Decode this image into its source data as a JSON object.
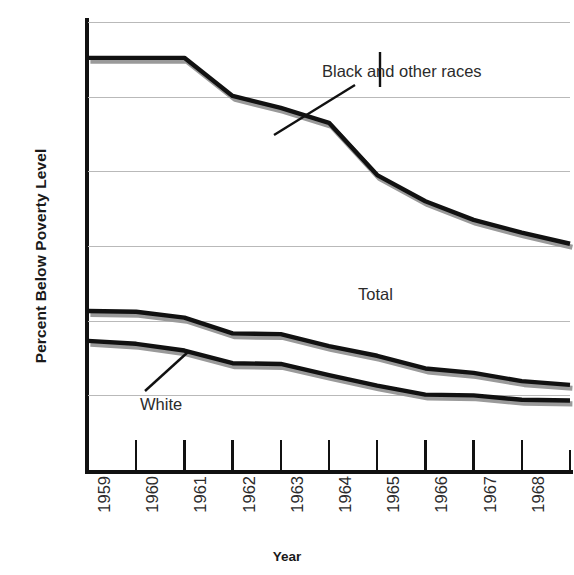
{
  "chart_data": {
    "type": "line",
    "title": "",
    "xlabel": "Year",
    "ylabel": "Percent Below Poverty Level",
    "x": [
      1959,
      1960,
      1961,
      1962,
      1963,
      1964,
      1965,
      1966,
      1967,
      1968,
      1969
    ],
    "categories": [
      "1959",
      "1960",
      "1961",
      "1962",
      "1963",
      "1964",
      "1965",
      "1966",
      "1967",
      "1968",
      "1969"
    ],
    "xlim": [
      1959,
      1969
    ],
    "ylim": [
      0,
      60
    ],
    "yticks": [
      0,
      10,
      20,
      30,
      40,
      50,
      60
    ],
    "ytick_labels": [
      "0",
      "10",
      "20",
      "30",
      "40",
      "50",
      "60"
    ],
    "grid": true,
    "legend_position": "inline-annotations",
    "series": [
      {
        "name": "Black and other races",
        "color": "#111111",
        "shadow_color": "#9a9a9a",
        "values": [
          55.2,
          55.2,
          55.2,
          50.1,
          48.5,
          46.5,
          39.5,
          36.0,
          33.5,
          31.8,
          30.3
        ]
      },
      {
        "name": "Total",
        "color": "#111111",
        "shadow_color": "#9a9a9a",
        "values": [
          21.3,
          21.2,
          20.4,
          18.3,
          18.2,
          16.6,
          15.3,
          13.6,
          13.0,
          11.9,
          11.4
        ]
      },
      {
        "name": "White",
        "color": "#111111",
        "shadow_color": "#9a9a9a",
        "values": [
          17.3,
          16.9,
          16.0,
          14.3,
          14.2,
          12.7,
          11.3,
          10.1,
          10.0,
          9.4,
          9.3
        ]
      }
    ],
    "annotations": [
      {
        "label": "Black and other races",
        "series": "Black and other races",
        "leader": "diagonal"
      },
      {
        "label": "Total",
        "series": "Total",
        "leader": "vertical"
      },
      {
        "label": "White",
        "series": "White",
        "leader": "diagonal"
      }
    ]
  },
  "axes": {
    "y_title": "Percent Below Poverty Level",
    "x_title": "Year"
  },
  "colors": {
    "line": "#111111",
    "shadow": "#9a9a9a",
    "grid": "#b9b9b9",
    "text": "#2b2b2b",
    "background": "#ffffff"
  }
}
